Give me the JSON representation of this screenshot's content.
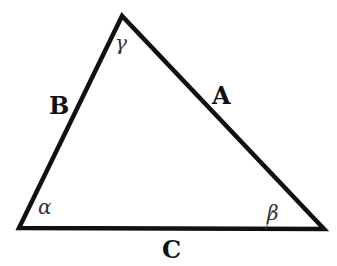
{
  "diagram": {
    "type": "triangle",
    "stroke_color": "#111111",
    "background": "#ffffff",
    "vertices": {
      "top": {
        "x": 122,
        "y": 16
      },
      "bottom_left": {
        "x": 19,
        "y": 228
      },
      "bottom_right": {
        "x": 324,
        "y": 229
      }
    },
    "sides": [
      {
        "id": "A",
        "label": "A",
        "between": [
          "top",
          "bottom_right"
        ]
      },
      {
        "id": "B",
        "label": "B",
        "between": [
          "top",
          "bottom_left"
        ]
      },
      {
        "id": "C",
        "label": "C",
        "between": [
          "bottom_left",
          "bottom_right"
        ]
      }
    ],
    "angles": [
      {
        "id": "alpha",
        "label": "α",
        "vertex": "bottom_left"
      },
      {
        "id": "beta",
        "label": "β",
        "vertex": "bottom_right"
      },
      {
        "id": "gamma",
        "label": "γ",
        "vertex": "top"
      }
    ]
  }
}
